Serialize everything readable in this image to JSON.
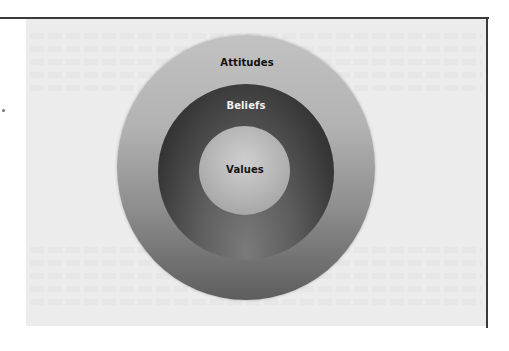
{
  "diagram": {
    "type": "concentric-circles",
    "layers": [
      {
        "id": "outer",
        "label": "Attitudes",
        "color_top": "#c2c2c2",
        "color_bottom": "#5d5d5d"
      },
      {
        "id": "middle",
        "label": "Beliefs",
        "color_top": "#262626",
        "color_bottom": "#7a7a7a"
      },
      {
        "id": "inner",
        "label": "Values",
        "color_center": "#cfcfcf",
        "color_edge": "#9a9a9a"
      }
    ]
  },
  "colors": {
    "panel_background": "#ececec",
    "frame_line": "#3a3a3a",
    "page_background": "#ffffff"
  }
}
